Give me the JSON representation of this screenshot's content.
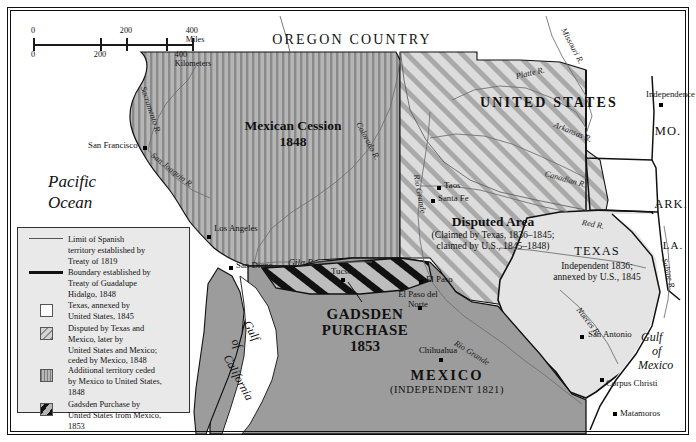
{
  "map": {
    "title": "Texas and the Mexican Cession",
    "scale": {
      "miles_ticks": [
        "0",
        "200",
        "400 Miles"
      ],
      "km_ticks": [
        "0",
        "200",
        "400 Kilometers"
      ]
    },
    "countries": [
      {
        "name": "OREGON COUNTRY"
      },
      {
        "name": "UNITED STATES"
      },
      {
        "name": "MEXICO",
        "sub": "(INDEPENDENT 1821)"
      }
    ],
    "regions": [
      {
        "name": "Mexican Cession",
        "year": "1848"
      },
      {
        "name": "Disputed Area",
        "sub1": "(Claimed by Texas, 1836–1845;",
        "sub2": "claimed by U.S., 1845–1848)"
      },
      {
        "name": "TEXAS",
        "sub1": "Independent 1836;",
        "sub2": "annexed by U.S., 1845"
      },
      {
        "name1": "GADSDEN",
        "name2": "PURCHASE",
        "year": "1853"
      }
    ],
    "states": [
      "MO.",
      "ARK.",
      "LA."
    ],
    "waters": [
      {
        "name": "Pacific",
        "name2": "Ocean"
      },
      {
        "name": "Gulf",
        "name2": "of",
        "name3": "Mexico"
      },
      {
        "name": "Gulf",
        "name2": "of",
        "name3": "California"
      }
    ],
    "rivers": [
      "Sacramento R.",
      "San Joaquin R.",
      "Colorado R.",
      "Gila R.",
      "Rio Grande",
      "Rio Grande",
      "Missouri R.",
      "Platte R.",
      "Arkansas R.",
      "Canadian R.",
      "Red R.",
      "Sabine R.",
      "Nueces R."
    ],
    "cities": [
      "San Francisco",
      "Los Angeles",
      "San Diego",
      "Tucson",
      "Taos",
      "Santa Fe",
      "El Paso",
      "El Paso del Norte",
      "Chihuahua",
      "San Antonio",
      "Corpus Christi",
      "Matamoros",
      "Independence"
    ]
  },
  "legend": {
    "items": [
      {
        "symbol": "thin-line",
        "text": "Limit of Spanish territory established by Treaty of 1819",
        "lines": [
          "Limit of Spanish",
          "territory established by",
          "Treaty of 1819"
        ]
      },
      {
        "symbol": "thick-line",
        "text": "Boundary established by Treaty of Guadalupe Hidalgo, 1848",
        "lines": [
          "Boundary established by",
          "Treaty of Guadalupe",
          "Hidalgo, 1848"
        ]
      },
      {
        "symbol": "white-box",
        "text": "Texas, annexed by United States, 1845",
        "lines": [
          "Texas, annexed by",
          "United States, 1845"
        ]
      },
      {
        "symbol": "diagonal-box",
        "text": "Disputed by Texas and Mexico, later by United States and Mexico; ceded by Mexico, 1848",
        "lines": [
          "Disputed by Texas and",
          "Mexico, later by",
          "United States and Mexico;",
          "ceded by Mexico, 1848"
        ]
      },
      {
        "symbol": "vertical-box",
        "text": "Additional territory ceded by Mexico to United States, 1848",
        "lines": [
          "Additional territory ceded",
          "by Mexico to United States,",
          "1848"
        ]
      },
      {
        "symbol": "black-diagonal-box",
        "text": "Gadsden Purchase by United States from Mexico, 1853",
        "lines": [
          "Gadsden Purchase by",
          "United States from Mexico,",
          "1853"
        ]
      }
    ]
  },
  "colors": {
    "cession_fill": "#b6b6b6",
    "disputed_fill": "#d8d8d8",
    "mexico_fill": "#9c9c9c",
    "texas_fill": "#e4e4e4",
    "gadsden_fill": "#111111",
    "ocean_fill": "#ffffff",
    "border": "#111111"
  }
}
